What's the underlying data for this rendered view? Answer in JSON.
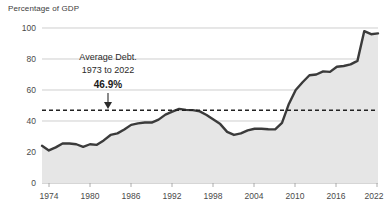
{
  "chart_data": {
    "type": "area",
    "title": "",
    "ylabel": "Percentage of GDP",
    "xlabel": "",
    "ylim": [
      0,
      100
    ],
    "xlim": [
      1973,
      2022
    ],
    "grid": true,
    "legend": "none",
    "y_ticks": [
      "0",
      "20",
      "40",
      "60",
      "80",
      "100"
    ],
    "y_tick_values": [
      0,
      20,
      40,
      60,
      80,
      100
    ],
    "x_ticks": [
      "1974",
      "1980",
      "1986",
      "1992",
      "1998",
      "2004",
      "2010",
      "2016",
      "2022"
    ],
    "x_tick_values": [
      1974,
      1980,
      1986,
      1992,
      1998,
      2004,
      2010,
      2016,
      2022
    ],
    "series": [
      {
        "name": "Federal Debt Held by the Public",
        "x": [
          1973,
          1974,
          1975,
          1976,
          1977,
          1978,
          1979,
          1980,
          1981,
          1982,
          1983,
          1984,
          1985,
          1986,
          1987,
          1988,
          1989,
          1990,
          1991,
          1992,
          1993,
          1994,
          1995,
          1996,
          1997,
          1998,
          1999,
          2000,
          2001,
          2002,
          2003,
          2004,
          2005,
          2006,
          2007,
          2008,
          2009,
          2010,
          2011,
          2012,
          2013,
          2014,
          2015,
          2016,
          2017,
          2018,
          2019,
          2020,
          2021,
          2022
        ],
        "values": [
          24.0,
          21.0,
          23.0,
          25.5,
          25.5,
          25.0,
          23.3,
          25.0,
          24.6,
          27.5,
          31.0,
          32.0,
          34.5,
          37.5,
          38.5,
          39.0,
          39.0,
          40.9,
          44.1,
          46.0,
          47.8,
          47.2,
          47.0,
          46.2,
          43.9,
          41.0,
          38.0,
          33.0,
          31.0,
          32.0,
          34.0,
          35.0,
          35.0,
          34.7,
          34.6,
          38.8,
          51.0,
          60.0,
          65.0,
          69.5,
          70.0,
          72.0,
          71.7,
          75.0,
          75.5,
          76.5,
          78.8,
          98.0,
          96.0,
          96.5
        ]
      }
    ],
    "annotations": [
      {
        "name": "average-debt",
        "label_line1": "Average Debt.",
        "label_line2": "1973 to 2022",
        "value": "46.9%",
        "value_numeric": 46.9,
        "reference_line": "dashed",
        "arrow": "down"
      }
    ],
    "colors": {
      "line": "#3b3b3b",
      "area": "#e6e6e6",
      "grid": "#b9b9b9",
      "dashed_reference": "#222222",
      "text": "#3c3c3c",
      "background": "#ffffff"
    }
  }
}
